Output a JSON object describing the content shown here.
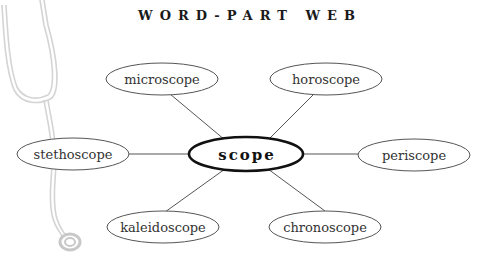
{
  "title": "WORD-PART WEB",
  "center": {
    "label": "scope"
  },
  "nodes": [
    {
      "label": "microscope"
    },
    {
      "label": "horoscope"
    },
    {
      "label": "stethoscope"
    },
    {
      "label": "periscope"
    },
    {
      "label": "kaleidoscope"
    },
    {
      "label": "chronoscope"
    }
  ],
  "illustration": {
    "icon": "stethoscope-icon"
  },
  "colors": {
    "line": "#555555",
    "center_border": "#111111",
    "illustration": "#cfcfcf"
  }
}
